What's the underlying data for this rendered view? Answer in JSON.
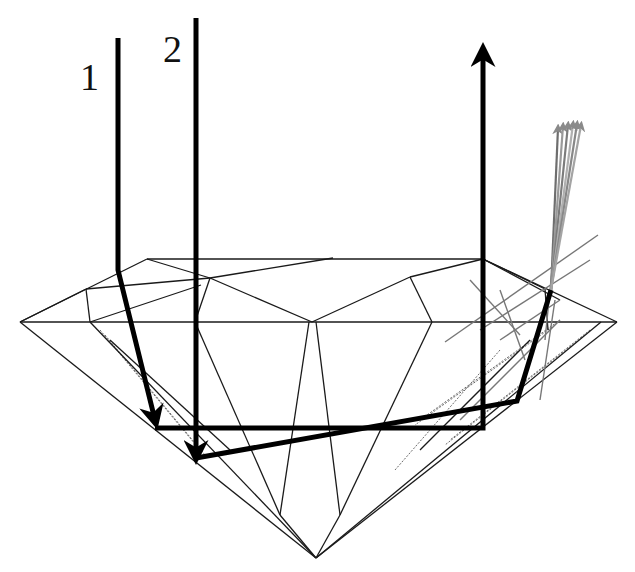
{
  "figure": {
    "type": "diamond light path diagram",
    "labels": [
      {
        "id": "ray-1",
        "text": "1",
        "x": 80,
        "y": 58
      },
      {
        "id": "ray-2",
        "text": "2",
        "x": 163,
        "y": 30
      }
    ]
  },
  "colors": {
    "background": "#ffffff",
    "ray": "#000000",
    "facet": "#1a1a1a",
    "scattered_rays": "#8a8a8a"
  },
  "geometry": {
    "table_outline": [
      [
        147,
        259
      ],
      [
        483,
        259
      ],
      [
        548,
        291
      ]
    ],
    "girdle": {
      "left": [
        20,
        322
      ],
      "right": [
        617,
        322
      ]
    },
    "crown_edges": [
      [
        [
          20,
          322
        ],
        [
          147,
          259
        ]
      ],
      [
        [
          147,
          259
        ],
        [
          483,
          259
        ]
      ],
      [
        [
          483,
          259
        ],
        [
          617,
          322
        ]
      ],
      [
        [
          147,
          259
        ],
        [
          210,
          278
        ]
      ],
      [
        [
          210,
          278
        ],
        [
          312,
          322
        ]
      ],
      [
        [
          312,
          322
        ],
        [
          410,
          277
        ]
      ],
      [
        [
          410,
          277
        ],
        [
          483,
          259
        ]
      ],
      [
        [
          210,
          278
        ],
        [
          333,
          258
        ]
      ],
      [
        [
          86,
          289
        ],
        [
          210,
          278
        ]
      ],
      [
        [
          86,
          289
        ],
        [
          90,
          322
        ]
      ],
      [
        [
          410,
          277
        ],
        [
          432,
          322
        ]
      ],
      [
        [
          210,
          278
        ],
        [
          195,
          322
        ]
      ],
      [
        [
          483,
          259
        ],
        [
          545,
          289
        ]
      ],
      [
        [
          545,
          289
        ],
        [
          548,
          330
        ]
      ],
      [
        [
          20,
          322
        ],
        [
          86,
          289
        ]
      ],
      [
        [
          90,
          322
        ],
        [
          201,
          285
        ]
      ],
      [
        [
          483,
          259
        ],
        [
          560,
          300
        ]
      ]
    ],
    "pavilion_edges": [
      [
        [
          20,
          322
        ],
        [
          316,
          558
        ]
      ],
      [
        [
          617,
          322
        ],
        [
          316,
          558
        ]
      ],
      [
        [
          90,
          322
        ],
        [
          316,
          558
        ]
      ],
      [
        [
          601,
          322
        ],
        [
          316,
          558
        ]
      ],
      [
        [
          195,
          322
        ],
        [
          280,
          515
        ]
      ],
      [
        [
          432,
          322
        ],
        [
          340,
          515
        ]
      ],
      [
        [
          309,
          322
        ],
        [
          280,
          515
        ]
      ],
      [
        [
          316,
          322
        ],
        [
          340,
          515
        ]
      ],
      [
        [
          280,
          515
        ],
        [
          316,
          558
        ]
      ],
      [
        [
          340,
          515
        ],
        [
          316,
          558
        ]
      ],
      [
        [
          110,
          340
        ],
        [
          230,
          450
        ]
      ],
      [
        [
          530,
          340
        ],
        [
          420,
          450
        ]
      ]
    ],
    "faint_edges": [
      [
        [
          100,
          330
        ],
        [
          200,
          450
        ]
      ],
      [
        [
          105,
          335
        ],
        [
          205,
          455
        ]
      ],
      [
        [
          590,
          330
        ],
        [
          450,
          440
        ]
      ],
      [
        [
          585,
          335
        ],
        [
          445,
          445
        ]
      ],
      [
        [
          560,
          320
        ],
        [
          420,
          420
        ]
      ],
      [
        [
          555,
          325
        ],
        [
          415,
          425
        ]
      ],
      [
        [
          500,
          350
        ],
        [
          395,
          470
        ]
      ]
    ],
    "rays": {
      "ray_1": {
        "points": [
          [
            118,
            38
          ],
          [
            118,
            270
          ],
          [
            155,
            420
          ]
        ],
        "arrow_at": [
          155,
          428
        ],
        "arrow_dir": "down"
      },
      "ray_1_bottom": {
        "points": [
          [
            155,
            428
          ],
          [
            483,
            428
          ],
          [
            483,
            52
          ]
        ],
        "arrow_at": [
          483,
          48
        ],
        "arrow_dir": "up"
      },
      "ray_2": {
        "points": [
          [
            196,
            18
          ],
          [
            196,
            455
          ]
        ],
        "arrow_at": [
          196,
          458
        ],
        "arrow_dir": "down"
      },
      "ray_2_exit": {
        "points": [
          [
            196,
            458
          ],
          [
            517,
            401
          ],
          [
            551,
            290
          ]
        ]
      }
    },
    "scattered_rays": {
      "origin": [
        551,
        290
      ],
      "tips": [
        [
          558,
          128
        ],
        [
          563,
          126
        ],
        [
          568,
          125
        ],
        [
          573,
          124
        ],
        [
          577,
          124
        ],
        [
          581,
          125
        ]
      ],
      "thin_lines": [
        [
          [
            445,
            342
          ],
          [
            598,
            235
          ]
        ],
        [
          [
            480,
            330
          ],
          [
            590,
            260
          ]
        ],
        [
          [
            470,
            280
          ],
          [
            520,
            335
          ]
        ],
        [
          [
            500,
            290
          ],
          [
            525,
            360
          ]
        ],
        [
          [
            545,
            340
          ],
          [
            555,
            240
          ]
        ],
        [
          [
            540,
            400
          ],
          [
            555,
            300
          ]
        ],
        [
          [
            500,
            340
          ],
          [
            560,
            300
          ]
        ],
        [
          [
            460,
            420
          ],
          [
            560,
            320
          ]
        ]
      ]
    }
  }
}
